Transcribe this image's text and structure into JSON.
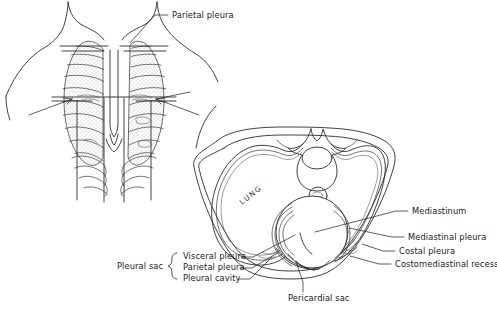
{
  "figure": {
    "background_color": "#ffffff",
    "ink_color": "#2b2b2b"
  },
  "panels": {
    "anterior": {
      "name": "Anterior thorax with ribcage and lungs",
      "label": "Parietal pleura",
      "inner_text": ""
    },
    "cross_section": {
      "name": "Transverse section of thorax",
      "lung_text": "LUNG"
    }
  },
  "labels": {
    "parietal_pleura_top": "Parietal pleura",
    "pleural_sac": "Pleural sac",
    "visceral_pleura": "Visceral pleura",
    "parietal_pleura": "Parietal pleura",
    "pleural_cavity": "Pleural cavity",
    "mediastinum": "Mediastinum",
    "mediastinal_pleura": "Mediastinal pleura",
    "costal_pleura": "Costal pleura",
    "costomediastinal_recess": "Costomediastinal recess",
    "pericardial_sac": "Pericardial sac",
    "lung": "LUNG"
  }
}
